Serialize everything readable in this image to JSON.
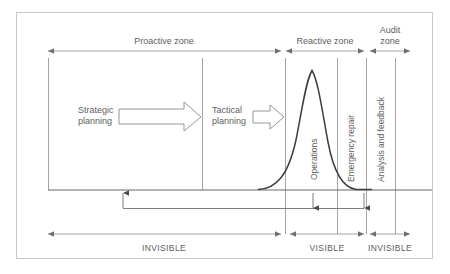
{
  "figure": {
    "title_visible": false,
    "colors": {
      "text": "#5e5e5e",
      "line": "#8a8a8a",
      "curve": "#3d3d3d",
      "frame": "#c9c9c9",
      "baseline": "#6b6b6b",
      "loop": "#7d7d7d",
      "background": "#ffffff"
    }
  },
  "zones": [
    {
      "id": "proactive",
      "label": "Proactive zone",
      "x_start": 48,
      "x_end": 281,
      "label_x": 164,
      "label_y": 42
    },
    {
      "id": "reactive",
      "label": "Reactive zone",
      "x_start": 285,
      "x_end": 364,
      "label_x": 325,
      "label_y": 42
    },
    {
      "id": "audit",
      "label_line1": "Audit",
      "label_line2": "zone",
      "label": "Audit zone",
      "x_start": 369,
      "x_end": 410,
      "label_x": 390,
      "label_y": 30
    }
  ],
  "phases": [
    {
      "id": "strategic-planning",
      "line1": "Strategic",
      "line2": "planning",
      "label": "Strategic planning",
      "text_x": 78,
      "text_y": 111,
      "arrow": {
        "x_start": 119,
        "x_end": 200,
        "y": 117,
        "size": "large"
      }
    },
    {
      "id": "tactical-planning",
      "line1": "Tactical",
      "line2": "planning",
      "label": "Tactical planning",
      "text_x": 212,
      "text_y": 111,
      "arrow": {
        "x_start": 253,
        "x_end": 285,
        "y": 117,
        "size": "small"
      }
    }
  ],
  "vertical_labels": [
    {
      "id": "operations",
      "label": "Operations",
      "x": 314,
      "y_bottom": 182
    },
    {
      "id": "emergency-repair",
      "label": "Emergency repair",
      "x": 351,
      "y_bottom": 182
    },
    {
      "id": "analysis-and-feedback",
      "label": "Analysis and feedback",
      "x": 381,
      "y_bottom": 182
    }
  ],
  "dividers": [
    {
      "id": "divider-left-axis",
      "x": 48,
      "y_top": 58,
      "y_bottom": 190
    },
    {
      "id": "divider-strategic-tactical",
      "x": 202,
      "y_top": 58,
      "y_bottom": 190
    },
    {
      "id": "divider-proactive-reactive",
      "x": 285,
      "y_top": 58,
      "y_bottom": 234
    },
    {
      "id": "divider-operations-emergency",
      "x": 337,
      "y_top": 58,
      "y_bottom": 234
    },
    {
      "id": "divider-emergency-analysis",
      "x": 366,
      "y_top": 58,
      "y_bottom": 234
    },
    {
      "id": "divider-right-edge",
      "x": 395,
      "y_top": 58,
      "y_bottom": 234
    }
  ],
  "curve": {
    "id": "failure-rate-curve",
    "description": "bell-shaped peak rising in the reactive zone",
    "baseline_y": 190,
    "peak_x": 312,
    "peak_y": 70,
    "rise_start_x": 270,
    "fall_end_x": 352
  },
  "feedback_loop": {
    "id": "feedback-loop",
    "y": 208,
    "x_left": 123,
    "x_right": 364,
    "up_arrow_x": 123,
    "down_arrows_x": [
      313,
      364
    ]
  },
  "visibility_scale": [
    {
      "id": "invisible-left",
      "label": "INVISIBLE",
      "x_start": 48,
      "x_end": 281,
      "label_x": 164,
      "label_y": 252
    },
    {
      "id": "visible",
      "label": "VISIBLE",
      "x_start": 290,
      "x_end": 364,
      "label_x": 327,
      "label_y": 252
    },
    {
      "id": "invisible-right",
      "label": "INVISIBLE",
      "x_start": 370,
      "x_end": 410,
      "label_x": 390,
      "label_y": 252
    }
  ],
  "frame": {
    "x": 16,
    "y": 12,
    "width": 417,
    "height": 247
  }
}
